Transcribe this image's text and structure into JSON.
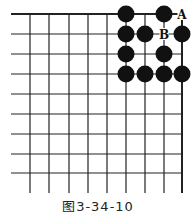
{
  "diagram": {
    "type": "go-board-corner",
    "grid": {
      "x_lines": [
        30,
        49,
        69,
        88,
        107,
        126,
        145,
        164,
        182
      ],
      "y_lines": [
        14,
        34,
        54,
        74,
        94,
        114,
        134,
        154,
        173
      ],
      "left_extent": 11,
      "bottom_extent": 193,
      "line_color": "#222222",
      "edge_line_width": 2
    },
    "stone_color": "#111111",
    "stone_radius": 8.5,
    "black_stones": [
      {
        "col": 5,
        "row": 0
      },
      {
        "col": 7,
        "row": 0
      },
      {
        "col": 5,
        "row": 1
      },
      {
        "col": 6,
        "row": 1
      },
      {
        "col": 8,
        "row": 1
      },
      {
        "col": 5,
        "row": 2
      },
      {
        "col": 7,
        "row": 2
      },
      {
        "col": 5,
        "row": 3
      },
      {
        "col": 6,
        "row": 3
      },
      {
        "col": 7,
        "row": 3
      },
      {
        "col": 8,
        "row": 3
      }
    ],
    "labels": [
      {
        "text": "A",
        "col": 8,
        "row": 0
      },
      {
        "text": "B",
        "col": 7,
        "row": 1
      }
    ]
  },
  "caption": "图3-34-10"
}
